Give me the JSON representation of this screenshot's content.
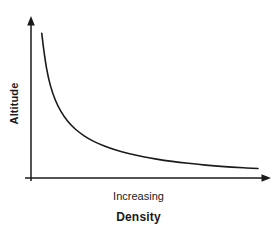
{
  "chart_data": {
    "type": "line",
    "title": "",
    "subtitle": "",
    "xlabel": "Density",
    "xlabel_secondary": "Increasing",
    "ylabel": "Altitude",
    "grid": false,
    "legend": false,
    "legend_position": "none",
    "axis_style": "arrow-tipped open axes, no tick marks, no numeric tick labels",
    "xlim": [
      0,
      1
    ],
    "ylim": [
      0,
      1
    ],
    "x_tick_labels": [],
    "y_tick_labels": [],
    "annotations": [],
    "series": [
      {
        "name": "Altitude vs Density",
        "color": "#1a1a1a",
        "line_width": 1.6,
        "x": [
          0.026,
          0.035,
          0.048,
          0.065,
          0.087,
          0.113,
          0.143,
          0.178,
          0.217,
          0.26,
          0.308,
          0.36,
          0.417,
          0.478,
          0.543,
          0.613,
          0.687,
          0.765,
          0.848,
          0.935,
          1.0
        ],
        "y": [
          0.955,
          0.845,
          0.718,
          0.606,
          0.51,
          0.432,
          0.368,
          0.315,
          0.271,
          0.234,
          0.203,
          0.176,
          0.153,
          0.133,
          0.116,
          0.101,
          0.088,
          0.076,
          0.066,
          0.058,
          0.053
        ]
      }
    ]
  },
  "figure": {
    "background_color": "#ffffff",
    "ink_color": "#1a1a1a",
    "y_axis_arrow": "arrow-up-icon",
    "x_axis_arrow": "arrow-right-icon"
  }
}
